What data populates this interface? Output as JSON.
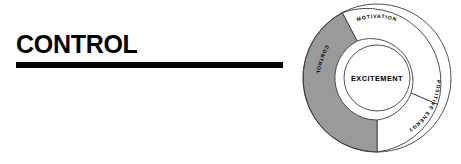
{
  "heading": {
    "title": "CONTROL",
    "rule_color": "#000000"
  },
  "diagram": {
    "name": "excitement-wheel",
    "hub_label": "EXCITEMENT",
    "segments": [
      {
        "id": "motivation",
        "label": "MOTIVATION",
        "fill": "#ffffff",
        "stroke": "#3c3c3c",
        "highlighted": false,
        "start_angle": -118,
        "end_angle": 35
      },
      {
        "id": "positive-energy",
        "label": "POSITIVE ENERGY",
        "fill": "#ffffff",
        "stroke": "#3c3c3c",
        "highlighted": false,
        "start_angle": 35,
        "end_angle": 180
      },
      {
        "id": "control",
        "label": "CONTROL",
        "fill": "#9a9a9a",
        "stroke": "#3c3c3c",
        "highlighted": true,
        "start_angle": 180,
        "end_angle": 242
      }
    ],
    "colors": {
      "highlight_gray": "#9a9a9a",
      "outline": "#3c3c3c",
      "background": "#ffffff"
    }
  }
}
